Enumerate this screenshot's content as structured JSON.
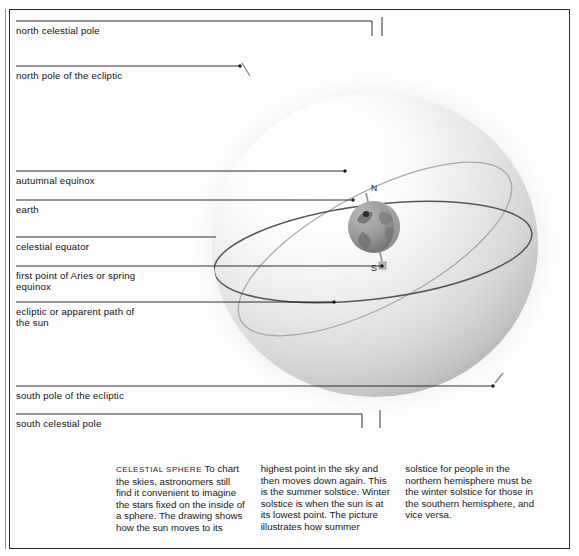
{
  "figure": {
    "title_ghost": ""
  },
  "labels": [
    {
      "id": "north-celestial-pole",
      "text": "north celestial pole"
    },
    {
      "id": "north-pole-ecliptic",
      "text": "north pole of the ecliptic"
    },
    {
      "id": "autumnal-equinox",
      "text": "autumnal equinox"
    },
    {
      "id": "earth",
      "text": "earth"
    },
    {
      "id": "celestial-equator",
      "text": "celestial equator"
    },
    {
      "id": "first-point-aries",
      "text": "first point of Aries or spring\nequinox"
    },
    {
      "id": "ecliptic",
      "text": "ecliptic or apparent path of\nthe sun"
    },
    {
      "id": "south-pole-ecliptic",
      "text": "south pole of the ecliptic"
    },
    {
      "id": "south-celestial-pole",
      "text": "south celestial pole"
    }
  ],
  "globe": {
    "north_axis_label": "N",
    "south_axis_label": "S"
  },
  "caption": {
    "lead": "CELESTIAL SPHERE",
    "col1": " To chart the skies, astronomers still find it convenient to imagine the stars fixed on the inside of a sphere. The drawing shows how the sun moves to its",
    "col2": "highest point in the sky and then moves down again. This is the summer solstice. Winter solstice is when the sun is at its lowest point. The picture illustrates how summer",
    "col3": "solstice for people in the northern hemisphere must be the winter solstice for those in the southern hemisphere, and vice versa."
  },
  "colors": {
    "frame": "#2b2b2b",
    "leader_line": "#1b1b1b",
    "celestial_equator": "#5b5b63",
    "ecliptic": "#9a9aa2",
    "sphere_light": "#ffffff",
    "sphere_mid": "#dcdcdc",
    "sphere_dark": "#b4b4b4",
    "earth": "#8a8a8a"
  }
}
